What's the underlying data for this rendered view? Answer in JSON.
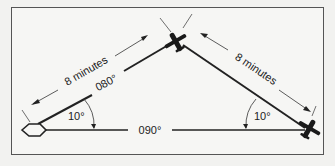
{
  "diagram": {
    "type": "navigation-time-distance",
    "labels": {
      "leg1_time": "8 minutes",
      "leg1_heading": "080°",
      "leg1_angle": "10°",
      "leg2_time": "8 minutes",
      "leg2_angle": "10°",
      "base_heading": "090°"
    },
    "colors": {
      "line": "#222222",
      "border": "#555555",
      "background": "#f6f6f4"
    },
    "elements": {
      "station": "hexagon-station-icon",
      "aircraft_top": "airplane-icon",
      "aircraft_right": "airplane-icon"
    }
  }
}
